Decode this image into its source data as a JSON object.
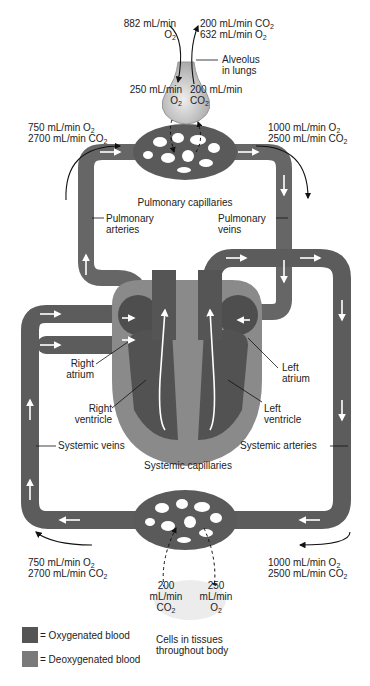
{
  "colors": {
    "vessel": "#6b6b6b",
    "vessel_dark": "#4a4a4a",
    "heart_wall": "#8a8a8a",
    "alveolus": "#c8c8c8",
    "oxygenated_swatch": "#555555",
    "deoxygenated_swatch": "#7a7a7a"
  },
  "lungs": {
    "in_top": {
      "value": "882 mL/min",
      "gas": "O",
      "sub": "2"
    },
    "out_top_1": {
      "value": "200 mL/min CO",
      "sub": "2"
    },
    "out_top_2": {
      "value": "632 mL/min O",
      "sub": "2"
    },
    "alveolus_label_1": "Alveolus",
    "alveolus_label_2": "in lungs",
    "to_blood": {
      "value": "250 mL/min",
      "gas": "O",
      "sub": "2"
    },
    "from_blood": {
      "value": "200 mL/min",
      "gas": "CO",
      "sub": "2"
    }
  },
  "pulmonary": {
    "in_1": {
      "value": "750 mL/min O",
      "sub": "2"
    },
    "in_2": {
      "value": "2700 mL/min CO",
      "sub": "2"
    },
    "out_1": {
      "value": "1000 mL/min O",
      "sub": "2"
    },
    "out_2": {
      "value": "2500 mL/min CO",
      "sub": "2"
    },
    "capillaries": "Pulmonary capillaries",
    "arteries_1": "Pulmonary",
    "arteries_2": "arteries",
    "veins_1": "Pulmonary",
    "veins_2": "veins"
  },
  "heart": {
    "right_atrium_1": "Right",
    "right_atrium_2": "atrium",
    "left_atrium_1": "Left",
    "left_atrium_2": "atrium",
    "right_ventricle_1": "Right",
    "right_ventricle_2": "ventricle",
    "left_ventricle_1": "Left",
    "left_ventricle_2": "ventricle"
  },
  "systemic": {
    "veins": "Systemic veins",
    "arteries": "Systemic arteries",
    "capillaries": "Systemic capillaries",
    "out_1": {
      "value": "750 mL/min O",
      "sub": "2"
    },
    "out_2": {
      "value": "2700 mL/min CO",
      "sub": "2"
    },
    "in_1": {
      "value": "1000 mL/min O",
      "sub": "2"
    },
    "in_2": {
      "value": "2500 mL/min CO",
      "sub": "2"
    }
  },
  "tissues": {
    "co2": {
      "value_1": "200",
      "value_2": "mL/min",
      "gas": "CO",
      "sub": "2"
    },
    "o2": {
      "value_1": "250",
      "value_2": "mL/min",
      "gas": "O",
      "sub": "2"
    },
    "label_1": "Cells in tissues",
    "label_2": "throughout body"
  },
  "legend": {
    "oxygenated": "= Oxygenated blood",
    "deoxygenated": "= Deoxygenated blood"
  }
}
